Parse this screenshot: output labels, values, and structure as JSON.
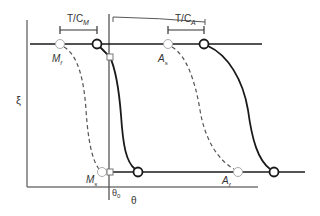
{
  "diagram": {
    "type": "phase-transformation-hysteresis",
    "y_axis_label": "ξ",
    "x_axis_label": "θ",
    "reference_temp_label": "θ",
    "reference_temp_subscript": "0",
    "brackets": [
      {
        "label_main": "T/C",
        "label_sub": "M"
      },
      {
        "label_main": "T/C",
        "label_sub": "A"
      }
    ],
    "points": [
      {
        "label_main": "M",
        "label_sub": "f"
      },
      {
        "label_main": "M",
        "label_sub": "s"
      },
      {
        "label_main": "A",
        "label_sub": "s"
      },
      {
        "label_main": "A",
        "label_sub": "f"
      }
    ],
    "colors": {
      "solid_curve": "#1a1a1a",
      "dashed_curve": "#555555",
      "axis": "#666666",
      "open_marker_fill": "#ffffff",
      "dashed_marker_stroke": "#aaaaaa"
    }
  }
}
